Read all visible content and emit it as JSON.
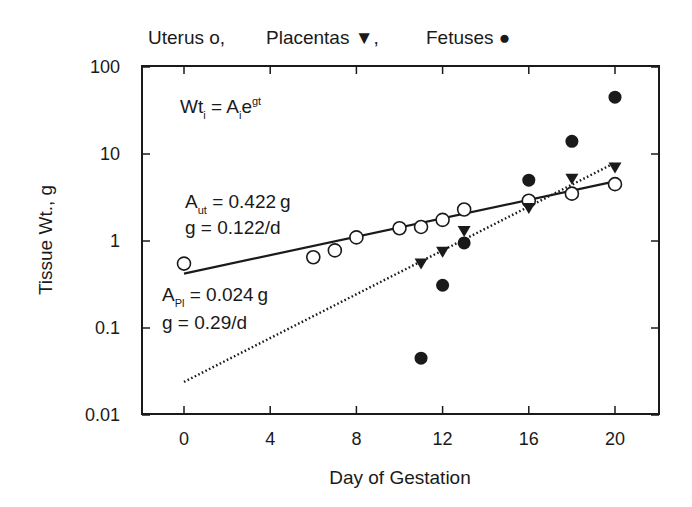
{
  "chart_data": {
    "type": "scatter",
    "title": "",
    "legend_text": {
      "uterus": "Uterus o,",
      "placentas": "Placentas ▼,",
      "fetuses": "Fetuses ●"
    },
    "legend_position": "top",
    "xlabel": "Day of Gestation",
    "ylabel": "Tissue Wt., g",
    "xlim": [
      -2,
      22
    ],
    "ylim": [
      0.01,
      100
    ],
    "yscale": "log",
    "grid": false,
    "x_ticks": [
      0,
      4,
      8,
      12,
      16,
      20
    ],
    "x_tick_labels": [
      "0",
      "4",
      "8",
      "12",
      "16",
      "20"
    ],
    "y_ticks": [
      0.01,
      0.1,
      1,
      10,
      100
    ],
    "y_tick_labels": [
      "0.01",
      "0.1",
      "1",
      "10",
      "100"
    ],
    "series": [
      {
        "name": "Uterus",
        "marker": "open-circle",
        "x": [
          0,
          6,
          7,
          8,
          10,
          11,
          12,
          13,
          16,
          18,
          20
        ],
        "y": [
          0.55,
          0.65,
          0.78,
          1.1,
          1.4,
          1.45,
          1.75,
          2.3,
          2.9,
          3.5,
          4.5
        ]
      },
      {
        "name": "Placentas",
        "marker": "filled-down-triangle",
        "x": [
          11,
          12,
          13,
          16,
          18,
          20
        ],
        "y": [
          0.55,
          0.75,
          1.3,
          2.4,
          5.2,
          7.0
        ]
      },
      {
        "name": "Fetuses",
        "marker": "filled-circle",
        "x": [
          11,
          12,
          13,
          16,
          18,
          20
        ],
        "y": [
          0.045,
          0.31,
          0.95,
          5.0,
          14,
          45
        ]
      }
    ],
    "fits": [
      {
        "name": "Uterus fit",
        "style": "solid",
        "A": 0.422,
        "g": 0.122,
        "x_range": [
          0,
          20
        ]
      },
      {
        "name": "Placenta fit",
        "style": "dotted",
        "A": 0.024,
        "g": 0.29,
        "x_range": [
          0,
          20
        ]
      }
    ],
    "annotations": {
      "equation": {
        "main": "Wt",
        "sub1": "i",
        "eq": " = A",
        "sub2": "i",
        "e": "e",
        "sup": "gt"
      },
      "uterus_A": {
        "prefix": "A",
        "sub": "ut",
        "value": " = 0.422 g"
      },
      "uterus_g": "g = 0.122/d",
      "placenta_A": {
        "prefix": "A",
        "sub": "Pl",
        "value": " = 0.024 g"
      },
      "placenta_g": "g = 0.29/d"
    }
  }
}
